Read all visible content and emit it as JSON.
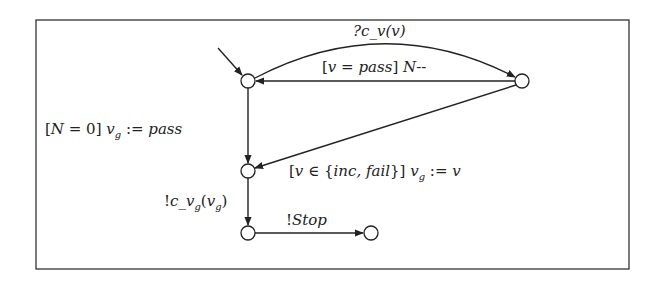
{
  "diagram": {
    "type": "timed-automaton",
    "frame": {
      "x": 36,
      "y": 20,
      "width": 593,
      "height": 249
    },
    "nodes": [
      {
        "id": "n1",
        "x": 248,
        "y": 81,
        "initial": true
      },
      {
        "id": "n2",
        "x": 522,
        "y": 81
      },
      {
        "id": "n3",
        "x": 248,
        "y": 171
      },
      {
        "id": "n4",
        "x": 248,
        "y": 233
      },
      {
        "id": "n5",
        "x": 371,
        "y": 233
      }
    ],
    "edges": [
      {
        "from": "n1",
        "to": "n2",
        "label": "?c_v(v)"
      },
      {
        "from": "n2",
        "to": "n1",
        "label": "[v = pass] N--"
      },
      {
        "from": "n1",
        "to": "n3",
        "label": "[N = 0] v_g := pass"
      },
      {
        "from": "n2",
        "to": "n3",
        "label": "[v ∈ {inc, fail}] v_g := v"
      },
      {
        "from": "n3",
        "to": "n4",
        "label": "!c_v_g(v_g)"
      },
      {
        "from": "n4",
        "to": "n5",
        "label": "!Stop"
      }
    ]
  },
  "labels": {
    "e1": {
      "pre": "?c",
      "sub": "_",
      "mid": "v(v)"
    },
    "e2": {
      "a": "[",
      "b": "v",
      "c": " = ",
      "d": "pass",
      "e": "]  ",
      "f": "N",
      "g": "--"
    },
    "e3": {
      "a": "[",
      "b": "N",
      "c": " = 0]  ",
      "d": "v",
      "sub": "g",
      "e": " := ",
      "f": "pass"
    },
    "e4": {
      "a": "[",
      "b": "v",
      "c": " ∈ {",
      "d": "inc, fail",
      "e": "}]  ",
      "f": "v",
      "sub": "g",
      "g": " := ",
      "h": "v"
    },
    "e5": {
      "a": "!",
      "b": "c",
      "c": "_",
      "d": "v",
      "sub1": "g",
      "e": "(",
      "f": "v",
      "sub2": "g",
      "g": ")"
    },
    "e6": {
      "a": "!",
      "b": "Stop"
    }
  }
}
